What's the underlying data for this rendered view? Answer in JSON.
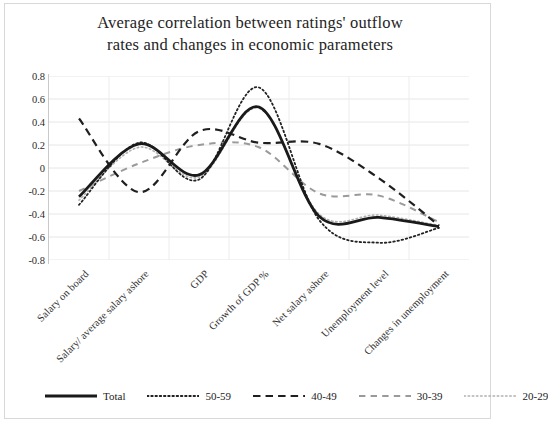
{
  "chart_data": {
    "type": "line",
    "title": "Average correlation between ratings' outflow rates and changes in economic parameters",
    "title_line1": "Average correlation between ratings' outflow",
    "title_line2": "rates and changes in economic parameters",
    "xlabel": "",
    "ylabel": "",
    "ylim": [
      -0.8,
      0.8
    ],
    "ytick_step": 0.2,
    "grid": true,
    "legend_position": "bottom",
    "yticks": [
      "0.8",
      "0.6",
      "0.4",
      "0.2",
      "0",
      "-0.2",
      "-0.4",
      "-0.6",
      "-0.8"
    ],
    "ytick_values": [
      0.8,
      0.6,
      0.4,
      0.2,
      0,
      -0.2,
      -0.4,
      -0.6,
      -0.8
    ],
    "categories": [
      "Salary on board",
      "Salary/ average salary ashore",
      "GDP",
      "Growth of GDP %",
      "Net salary ashore",
      "Unemployment level",
      "Changes in unemployment"
    ],
    "series": [
      {
        "name": "Total",
        "style": "solid",
        "color": "#1a1a1a",
        "width": 2.8,
        "values": [
          -0.25,
          0.21,
          -0.06,
          0.53,
          -0.42,
          -0.43,
          -0.51
        ]
      },
      {
        "name": "50-59",
        "style": "dotted",
        "color": "#222222",
        "width": 1.8,
        "values": [
          -0.32,
          0.22,
          -0.1,
          0.7,
          -0.45,
          -0.65,
          -0.52
        ]
      },
      {
        "name": "40-49",
        "style": "dashed",
        "color": "#1f1f1f",
        "width": 2.2,
        "values": [
          0.43,
          -0.21,
          0.32,
          0.22,
          0.21,
          -0.09,
          -0.5
        ]
      },
      {
        "name": "30-39",
        "style": "dashed-light",
        "color": "#9a9a9a",
        "width": 2.0,
        "values": [
          -0.2,
          0.04,
          0.2,
          0.18,
          -0.22,
          -0.24,
          -0.47
        ]
      },
      {
        "name": "20-29",
        "style": "dotted-light",
        "color": "#b0b0b0",
        "width": 1.6,
        "values": [
          -0.28,
          0.18,
          -0.08,
          0.52,
          -0.4,
          -0.41,
          -0.5
        ]
      }
    ]
  },
  "legend": {
    "items": [
      {
        "label": "Total"
      },
      {
        "label": "50-59"
      },
      {
        "label": "40-49"
      },
      {
        "label": "30-39"
      },
      {
        "label": "20-29"
      }
    ]
  }
}
